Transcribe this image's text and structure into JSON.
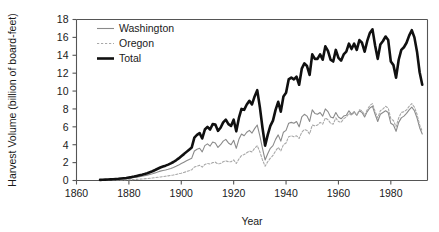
{
  "chart_data": {
    "type": "line",
    "title": "",
    "xlabel": "Year",
    "ylabel": "Harvest Volume (billion of board-feet)",
    "xlim": [
      1860,
      1994
    ],
    "ylim": [
      0,
      18
    ],
    "xticks": [
      1860,
      1880,
      1900,
      1920,
      1940,
      1960,
      1980
    ],
    "yticks": [
      0,
      2,
      4,
      6,
      8,
      10,
      12,
      14,
      16,
      18
    ],
    "grid": false,
    "legend_position": "top-left-inside",
    "legend": [
      "Washington",
      "Oregon",
      "Total"
    ],
    "colors": {
      "washington": "#8a8a8a",
      "oregon": "#a8a8a8",
      "total": "#101010",
      "axis": "#555555",
      "text": "#1a1a1a",
      "background": "#ffffff"
    },
    "x": [
      1869,
      1870,
      1871,
      1872,
      1873,
      1874,
      1875,
      1876,
      1877,
      1878,
      1879,
      1880,
      1881,
      1882,
      1883,
      1884,
      1885,
      1886,
      1887,
      1888,
      1889,
      1890,
      1891,
      1892,
      1893,
      1894,
      1895,
      1896,
      1897,
      1898,
      1899,
      1900,
      1901,
      1902,
      1903,
      1904,
      1905,
      1906,
      1907,
      1908,
      1909,
      1910,
      1911,
      1912,
      1913,
      1914,
      1915,
      1916,
      1917,
      1918,
      1919,
      1920,
      1921,
      1922,
      1923,
      1924,
      1925,
      1926,
      1927,
      1928,
      1929,
      1930,
      1931,
      1932,
      1933,
      1934,
      1935,
      1936,
      1937,
      1938,
      1939,
      1940,
      1941,
      1942,
      1943,
      1944,
      1945,
      1946,
      1947,
      1948,
      1949,
      1950,
      1951,
      1952,
      1953,
      1954,
      1955,
      1956,
      1957,
      1958,
      1959,
      1960,
      1961,
      1962,
      1963,
      1964,
      1965,
      1966,
      1967,
      1968,
      1969,
      1970,
      1971,
      1972,
      1973,
      1974,
      1975,
      1976,
      1977,
      1978,
      1979,
      1980,
      1981,
      1982,
      1983,
      1984,
      1985,
      1986,
      1987,
      1988,
      1989,
      1990,
      1991,
      1992
    ],
    "series": [
      {
        "name": "Washington",
        "style": "thin-solid-gray",
        "values": [
          0.05,
          0.06,
          0.07,
          0.08,
          0.09,
          0.1,
          0.12,
          0.14,
          0.16,
          0.18,
          0.2,
          0.24,
          0.28,
          0.33,
          0.38,
          0.43,
          0.48,
          0.54,
          0.6,
          0.68,
          0.76,
          0.85,
          0.95,
          1.05,
          1.12,
          1.18,
          1.26,
          1.35,
          1.45,
          1.58,
          1.72,
          1.9,
          2.05,
          2.2,
          2.35,
          2.5,
          3.3,
          3.5,
          3.6,
          3.2,
          3.9,
          4.1,
          3.85,
          4.3,
          4.2,
          3.7,
          4.0,
          4.4,
          4.6,
          4.2,
          4.0,
          4.5,
          3.6,
          4.6,
          5.2,
          5.0,
          5.4,
          5.6,
          5.3,
          5.8,
          6.2,
          5.0,
          3.6,
          2.3,
          3.0,
          3.6,
          3.9,
          4.6,
          5.1,
          4.4,
          5.4,
          5.6,
          6.4,
          6.5,
          6.4,
          6.6,
          6.0,
          7.1,
          7.4,
          7.2,
          6.6,
          7.9,
          7.5,
          7.4,
          7.6,
          7.2,
          8.0,
          7.7,
          7.1,
          7.0,
          7.6,
          7.1,
          6.9,
          7.2,
          7.3,
          7.8,
          7.4,
          7.7,
          7.3,
          7.8,
          7.6,
          7.1,
          7.7,
          8.1,
          8.3,
          7.4,
          6.6,
          7.4,
          7.6,
          7.8,
          7.6,
          6.4,
          6.2,
          5.5,
          6.5,
          7.0,
          7.2,
          7.5,
          7.9,
          8.2,
          7.8,
          7.0,
          5.9,
          5.2
        ]
      },
      {
        "name": "Oregon",
        "style": "thin-dashed-gray",
        "values": [
          0.02,
          0.02,
          0.03,
          0.03,
          0.04,
          0.04,
          0.05,
          0.05,
          0.06,
          0.07,
          0.08,
          0.09,
          0.1,
          0.11,
          0.13,
          0.15,
          0.17,
          0.19,
          0.22,
          0.25,
          0.28,
          0.32,
          0.36,
          0.4,
          0.44,
          0.48,
          0.52,
          0.57,
          0.62,
          0.68,
          0.75,
          0.82,
          0.9,
          1.0,
          1.1,
          1.2,
          1.5,
          1.6,
          1.7,
          1.5,
          1.8,
          1.9,
          1.85,
          2.0,
          2.05,
          1.85,
          1.9,
          2.1,
          2.2,
          2.1,
          2.1,
          2.3,
          1.9,
          2.4,
          2.8,
          2.9,
          3.1,
          3.3,
          3.2,
          3.6,
          3.9,
          3.2,
          2.3,
          1.6,
          2.1,
          2.5,
          2.8,
          3.3,
          3.7,
          3.3,
          4.0,
          4.2,
          4.9,
          5.0,
          4.9,
          5.0,
          4.7,
          5.4,
          5.7,
          5.6,
          5.2,
          6.2,
          6.1,
          6.2,
          6.5,
          6.3,
          7.0,
          6.8,
          6.4,
          6.3,
          7.0,
          6.6,
          6.5,
          6.9,
          7.1,
          7.5,
          7.3,
          7.6,
          7.3,
          7.9,
          7.8,
          7.3,
          7.9,
          8.4,
          8.6,
          7.7,
          7.0,
          7.8,
          8.0,
          8.3,
          8.1,
          6.9,
          6.7,
          6.0,
          7.0,
          7.6,
          7.7,
          7.9,
          8.3,
          8.6,
          8.2,
          7.4,
          6.2,
          5.5
        ]
      },
      {
        "name": "Total",
        "style": "thick-black",
        "values": [
          0.07,
          0.08,
          0.1,
          0.11,
          0.13,
          0.14,
          0.17,
          0.19,
          0.22,
          0.25,
          0.28,
          0.33,
          0.38,
          0.44,
          0.51,
          0.58,
          0.65,
          0.73,
          0.82,
          0.93,
          1.04,
          1.17,
          1.31,
          1.45,
          1.56,
          1.66,
          1.78,
          1.92,
          2.07,
          2.26,
          2.47,
          2.72,
          2.95,
          3.2,
          3.45,
          3.7,
          4.8,
          5.1,
          5.3,
          4.7,
          5.7,
          6.0,
          5.7,
          6.3,
          6.25,
          5.55,
          5.9,
          6.5,
          6.8,
          6.3,
          6.1,
          6.8,
          5.5,
          7.0,
          8.0,
          7.9,
          8.5,
          8.9,
          8.5,
          9.4,
          10.1,
          8.2,
          5.9,
          3.9,
          5.1,
          6.1,
          6.7,
          7.9,
          8.8,
          7.7,
          9.4,
          9.8,
          11.3,
          11.5,
          11.3,
          11.6,
          10.7,
          12.5,
          13.1,
          12.8,
          11.8,
          14.1,
          13.6,
          13.6,
          14.1,
          13.5,
          15.0,
          14.5,
          13.5,
          13.3,
          14.6,
          13.7,
          13.4,
          14.1,
          14.4,
          15.3,
          14.7,
          15.3,
          14.6,
          15.7,
          15.4,
          14.4,
          15.6,
          16.5,
          16.9,
          15.1,
          13.6,
          15.2,
          15.6,
          16.1,
          15.7,
          13.3,
          12.9,
          11.5,
          13.5,
          14.6,
          14.9,
          15.4,
          16.2,
          16.8,
          16.0,
          14.4,
          12.1,
          10.7
        ]
      }
    ]
  }
}
